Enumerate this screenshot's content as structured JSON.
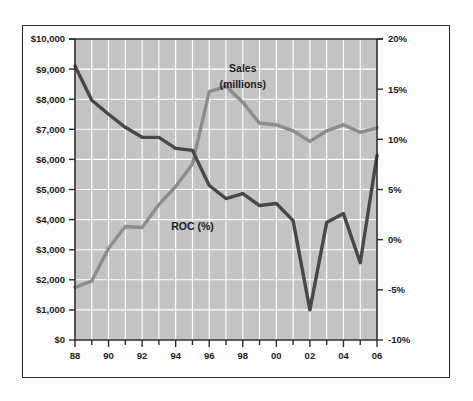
{
  "chart_data": {
    "type": "line",
    "title": "",
    "xlabel": "",
    "grid": true,
    "legend_position": "inline-annotations",
    "plot_background": "#c3c3c3",
    "frame_color": "#2b2b2b",
    "gridline_color": "#ffffff",
    "x": [
      1988,
      1989,
      1990,
      1991,
      1992,
      1993,
      1994,
      1995,
      1996,
      1997,
      1998,
      1999,
      2000,
      2001,
      2002,
      2003,
      2004,
      2005,
      2006
    ],
    "xtick_labels": [
      "88",
      "90",
      "92",
      "94",
      "96",
      "98",
      "00",
      "02",
      "04",
      "06"
    ],
    "xtick_values": [
      1988,
      1990,
      1992,
      1994,
      1996,
      1998,
      2000,
      2002,
      2004,
      2006
    ],
    "xlim": [
      1988,
      2006
    ],
    "axes": [
      {
        "id": "left",
        "name": "Sales (millions)",
        "ylabel": "",
        "ylim": [
          0,
          10000
        ],
        "tick_values": [
          0,
          1000,
          2000,
          3000,
          4000,
          5000,
          6000,
          7000,
          8000,
          9000,
          10000
        ],
        "tick_labels": [
          "$0",
          "$1,000",
          "$2,000",
          "$3,000",
          "$4,000",
          "$5,000",
          "$6,000",
          "$7,000",
          "$8,000",
          "$9,000",
          "$10,000"
        ]
      },
      {
        "id": "right",
        "name": "ROC (%)",
        "ylabel": "",
        "ylim": [
          -10,
          20
        ],
        "tick_values": [
          -10,
          -5,
          0,
          5,
          10,
          15,
          20
        ],
        "tick_labels": [
          "-10%",
          "-5%",
          "0%",
          "5%",
          "10%",
          "15%",
          "20%"
        ]
      }
    ],
    "series": [
      {
        "name": "Sales (millions)",
        "axis": "left",
        "color": "#8c8c8c",
        "line_width": 3.4,
        "annotation": {
          "lines": [
            "Sales",
            "(millions)"
          ],
          "x": 1998,
          "y": 8900
        },
        "values": [
          1750,
          1960,
          3050,
          3770,
          3740,
          4500,
          5100,
          5850,
          8250,
          8430,
          7900,
          7200,
          7150,
          6950,
          6600,
          6950,
          7150,
          6900,
          7050
        ]
      },
      {
        "name": "ROC (%)",
        "axis": "right",
        "color": "#474747",
        "line_width": 3.4,
        "annotation": {
          "lines": [
            "ROC (%)"
          ],
          "x": 1995,
          "y": 1.0
        },
        "values": [
          17.3,
          13.9,
          12.5,
          11.2,
          10.2,
          10.2,
          9.1,
          8.9,
          5.4,
          4.1,
          4.6,
          3.4,
          3.6,
          1.9,
          -7.0,
          1.7,
          2.6,
          -2.3,
          8.4
        ]
      }
    ]
  },
  "annotations": {
    "sales_line_1": "Sales",
    "sales_line_2": "(millions)",
    "roc_label": "ROC (%)"
  }
}
